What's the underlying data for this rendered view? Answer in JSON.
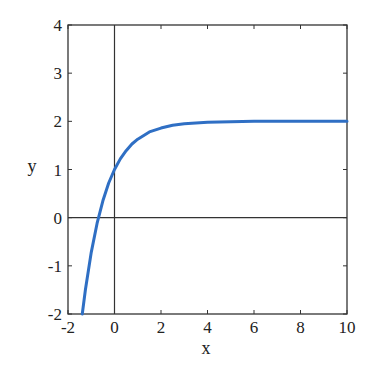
{
  "chart_data": {
    "type": "line",
    "title": "",
    "xlabel": "x",
    "ylabel": "y",
    "xlim": [
      -2,
      10
    ],
    "ylim": [
      -2,
      4
    ],
    "xticks": [
      -2,
      0,
      2,
      4,
      6,
      8,
      10
    ],
    "yticks": [
      -2,
      -1,
      0,
      1,
      2,
      3,
      4
    ],
    "xtick_labels": [
      "-2",
      "0",
      "2",
      "4",
      "6",
      "8",
      "10"
    ],
    "ytick_labels": [
      "-2",
      "-1",
      "0",
      "1",
      "2",
      "3",
      "4"
    ],
    "grid": false,
    "legend": null,
    "reference_lines": [
      {
        "orientation": "vertical",
        "x": 0
      },
      {
        "orientation": "horizontal",
        "y": 0
      }
    ],
    "series": [
      {
        "name": "y = 2 - e^(-x)",
        "color": "#2f6fc4",
        "x": [
          -1.386,
          -1.25,
          -1.0,
          -0.75,
          -0.5,
          -0.25,
          0,
          0.25,
          0.5,
          0.75,
          1.0,
          1.5,
          2.0,
          2.5,
          3.0,
          4.0,
          5.0,
          6.0,
          8.0,
          10.0
        ],
        "y": [
          -2.0,
          -1.49,
          -0.72,
          -0.12,
          0.35,
          0.72,
          1.0,
          1.22,
          1.39,
          1.53,
          1.63,
          1.78,
          1.86,
          1.92,
          1.95,
          1.98,
          1.99,
          2.0,
          2.0,
          2.0
        ]
      }
    ]
  }
}
